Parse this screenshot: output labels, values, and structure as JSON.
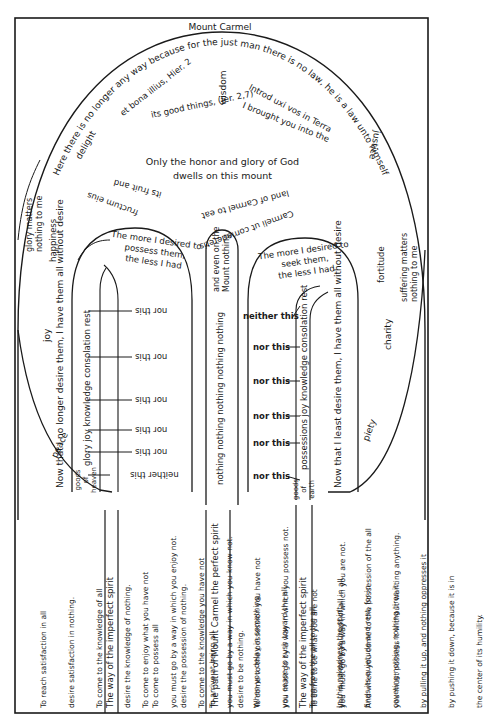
{
  "title": "Mount Carmel",
  "summit": {
    "arc_text": "Here there is no longer any way because for the just man there is no law, he is a law unto himself",
    "virtues": {
      "wisdom": "wisdom",
      "delight": "delight",
      "justice": "justice",
      "joy": "joy",
      "charity": "charity",
      "peace": "peace",
      "piety": "piety",
      "fortitude": "fortitude",
      "happiness": "happiness"
    },
    "glory_note": [
      "glory matters",
      "nothing to me"
    ],
    "suffering_note": [
      "suffering matters",
      "nothing to me"
    ],
    "left_latin": [
      "et bona illius, Hier. 2",
      "fructum eius",
      "its fruit and"
    ],
    "left_english": "its good things, (Jer. 2,7)",
    "right_latin": [
      "Introd uxi vos in Terra",
      "Carmeli ut comederetis"
    ],
    "right_english": [
      "I brought you into the",
      "land of Carmel to eat"
    ],
    "center_lines": [
      "Only the honor and glory of God",
      "dwells on this mount"
    ]
  },
  "left_path": {
    "arch_text": [
      "The more I desired to",
      "possess them,",
      "the less I had"
    ],
    "side_text": "Now that I no longer desire them, I have them all without desire",
    "goods_label": [
      "goods",
      "of",
      "heaven"
    ],
    "goods_list": "glory  joy  knowledge  consolation  rest",
    "markers": [
      "nor this",
      "nor this",
      "nor this",
      "nor this",
      "nor this",
      "neither this"
    ]
  },
  "center_path": {
    "top_text": [
      "and even on the",
      "Mount nothing"
    ],
    "main_text": "nothing nothing nothing nothing nothing"
  },
  "right_path": {
    "arch_text": [
      "The more I desired to",
      "seek them,",
      "the less I had"
    ],
    "side_text": "Now that I least desire them, I have them all without desire",
    "goods_label": [
      "goods",
      "of",
      "earth"
    ],
    "goods_list": "possessions  joy  knowledge  consolation  rest",
    "markers": [
      "neither this",
      "nor this",
      "nor this",
      "nor this",
      "nor this",
      "nor this"
    ]
  },
  "bottom_columns": [
    {
      "heading": "",
      "lines": [
        "To reach satisfaction in all",
        "desire satisfaction in nothing.",
        "To come to the knowledge of all",
        "desire the knowledge of nothing.",
        "To come to possess all",
        "desire the possession of nothing.",
        "To arrive at being all",
        "desire to be nothing."
      ]
    },
    {
      "heading": "The way of the imperfect spirit",
      "lines": [
        "To come to enjoy what you have not",
        "you must go by a way in which you enjoy not.",
        "To come to the knowledge you have not",
        "you must go by a way in which you know not.",
        "To come to the possession you have not",
        "you must go by a way in which you possess not.",
        "To come to be what you are not",
        "you  must go by a way in which you are not."
      ]
    },
    {
      "heading": "The path of Mount Carmel the perfect spirit",
      "lines": [
        "When you delay in something",
        "you cease to rush toward the all.",
        "To go from the all to the all",
        "you must deny yourself of all in all.",
        "And when you come to the possession of the all",
        "you must possess it without wanting anything."
      ]
    },
    {
      "heading": "The way of the imperfect spirit",
      "lines": [
        "In this nakedness the spirit",
        "finds its quietude and rest, for in",
        "coveting nothing, nothing tires it",
        "by pulling it up, and nothing oppresses it",
        "by pushing it down, because it is in",
        "the center of its humility."
      ]
    }
  ],
  "colors": {
    "ink": "#1a1a1a",
    "paper": "#ffffff"
  }
}
